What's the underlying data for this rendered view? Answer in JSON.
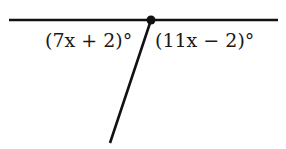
{
  "diagram": {
    "type": "angle-pair",
    "line": {
      "x1": 9,
      "y1": 20,
      "x2": 278,
      "y2": 20
    },
    "vertex": {
      "x": 151,
      "y": 20
    },
    "ray": {
      "x1": 151,
      "y1": 20,
      "x2": 110,
      "y2": 143
    },
    "stroke_color": "#111111",
    "labels": {
      "left_angle": "(7x + 2)°",
      "right_angle": "(11x − 2)°"
    }
  }
}
